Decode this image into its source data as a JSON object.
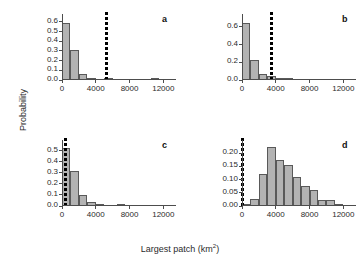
{
  "figure": {
    "xlabel_main": "Largest patch (km",
    "xlabel_unit_sup": "2",
    "xlabel_close": ")",
    "ylabel": "Probability",
    "bar_fill": "#b3b3b3",
    "bar_edge": "#595959",
    "line_color": "#000000",
    "axis_color": "#4d4d4d"
  },
  "chart_data": [
    {
      "type": "bar",
      "panel": "a",
      "title": "",
      "xlabel": "Largest patch (km2)",
      "ylabel": "Probability",
      "xlim": [
        0,
        13500
      ],
      "ylim": [
        0,
        0.64
      ],
      "xticks": [
        0,
        4000,
        8000,
        12000
      ],
      "xticklabels": [
        "0",
        "4000",
        "8000",
        "12000"
      ],
      "yticks": [
        0.0,
        0.1,
        0.2,
        0.3,
        0.4,
        0.5,
        0.6
      ],
      "yticklabels": [
        "0.0",
        "0.1",
        "0.2",
        "0.3",
        "0.4",
        "0.5",
        "0.6"
      ],
      "bin_width": 1000,
      "bin_starts": [
        0,
        1000,
        2000,
        3000,
        5000,
        10500
      ],
      "values": [
        0.59,
        0.31,
        0.062,
        0.02,
        0.015,
        0.004
      ],
      "vline_x": 5250,
      "grid": false,
      "legend": "none"
    },
    {
      "type": "bar",
      "panel": "b",
      "title": "",
      "xlabel": "Largest patch (km2)",
      "ylabel": "Probability",
      "xlim": [
        0,
        13500
      ],
      "ylim": [
        0,
        0.7
      ],
      "xticks": [
        0,
        4000,
        8000,
        12000
      ],
      "xticklabels": [
        "0",
        "4000",
        "8000",
        "12000"
      ],
      "yticks": [
        0.0,
        0.2,
        0.4,
        0.6
      ],
      "yticklabels": [
        "0.0",
        "0.2",
        "0.4",
        "0.6"
      ],
      "bin_width": 1000,
      "bin_starts": [
        0,
        1000,
        2000,
        3000,
        4000,
        5000
      ],
      "values": [
        0.645,
        0.23,
        0.065,
        0.045,
        0.012,
        0.005
      ],
      "vline_x": 3400,
      "grid": false,
      "legend": "none"
    },
    {
      "type": "bar",
      "panel": "c",
      "title": "",
      "xlabel": "Largest patch (km2)",
      "ylabel": "Probability",
      "xlim": [
        0,
        13500
      ],
      "ylim": [
        0,
        0.56
      ],
      "xticks": [
        0,
        4000,
        8000,
        12000
      ],
      "xticklabels": [
        "0",
        "4000",
        "8000",
        "12000"
      ],
      "yticks": [
        0.0,
        0.1,
        0.2,
        0.3,
        0.4,
        0.5
      ],
      "yticklabels": [
        "0.0",
        "0.1",
        "0.2",
        "0.3",
        "0.4",
        "0.5"
      ],
      "bin_width": 1000,
      "bin_starts": [
        0,
        1000,
        2000,
        3000,
        4000,
        6500
      ],
      "values": [
        0.52,
        0.32,
        0.098,
        0.035,
        0.012,
        0.006
      ],
      "vline_x": 400,
      "grid": false,
      "legend": "none"
    },
    {
      "type": "bar",
      "panel": "d",
      "title": "",
      "xlabel": "Largest patch (km2)",
      "ylabel": "Probability",
      "xlim": [
        0,
        13500
      ],
      "ylim": [
        0,
        0.235
      ],
      "xticks": [
        0,
        4000,
        8000,
        12000
      ],
      "xticklabels": [
        "0",
        "4000",
        "8000",
        "12000"
      ],
      "yticks": [
        0.0,
        0.05,
        0.1,
        0.15,
        0.2
      ],
      "yticklabels": [
        "0.00",
        "0.05",
        "0.10",
        "0.15",
        "0.20"
      ],
      "bin_width": 1000,
      "bin_starts": [
        0,
        1000,
        2000,
        3000,
        4000,
        5000,
        6000,
        7000,
        8000,
        9000,
        10000,
        11000,
        12000
      ],
      "values": [
        0.003,
        0.028,
        0.12,
        0.225,
        0.175,
        0.157,
        0.11,
        0.077,
        0.06,
        0.022,
        0.022,
        0.007,
        0.0
      ],
      "vline_x": 40,
      "grid": false,
      "legend": "none"
    }
  ],
  "panel_labels": {
    "a": "a",
    "b": "b",
    "c": "c",
    "d": "d"
  }
}
